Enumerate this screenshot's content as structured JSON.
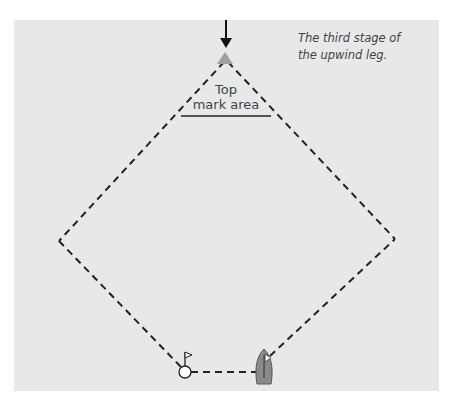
{
  "caption": {
    "line1": "The third stage of",
    "line2": "the upwind leg."
  },
  "top_mark_area": {
    "line1": "Top",
    "line2": "mark area"
  },
  "icons": {
    "wind_arrow": "down-arrow-icon",
    "top_mark": "triangle-mark-icon",
    "start_mark": "flag-buoy-icon",
    "boat": "sailboat-icon"
  },
  "colors": {
    "panel_bg": "#e8e8e8",
    "mark": "#a0a0a0",
    "boat": "#8a8a8a",
    "line": "#222222"
  }
}
